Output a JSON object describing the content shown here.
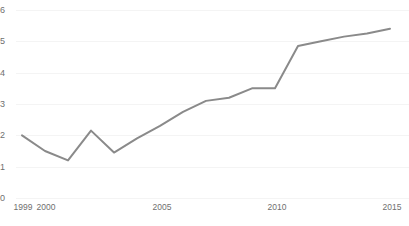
{
  "chart_data": {
    "type": "line",
    "title": "",
    "subtitle": "",
    "xlabel": "",
    "ylabel": "",
    "x": [
      1999,
      2000,
      2001,
      2002,
      2003,
      2004,
      2005,
      2006,
      2007,
      2008,
      2009,
      2010,
      2011,
      2012,
      2013,
      2014,
      2015
    ],
    "values": [
      2.0,
      1.5,
      1.2,
      2.15,
      1.45,
      1.9,
      2.3,
      2.75,
      3.1,
      3.2,
      3.5,
      3.5,
      4.85,
      5.0,
      5.15,
      5.25,
      5.4
    ],
    "series": [
      {
        "name": "series-1",
        "color": "#8a8a8a",
        "values": [
          2.0,
          1.5,
          1.2,
          2.15,
          1.45,
          1.9,
          2.3,
          2.75,
          3.1,
          3.2,
          3.5,
          3.5,
          4.85,
          5.0,
          5.15,
          5.25,
          5.4
        ]
      }
    ],
    "xlim": [
      1999,
      2015
    ],
    "ylim": [
      0,
      6
    ],
    "y_ticks": [
      "0",
      "1",
      "2",
      "3",
      "4",
      "5",
      "6"
    ],
    "y_tick_values": [
      0,
      1,
      2,
      3,
      4,
      5,
      6
    ],
    "x_ticks": [
      "1999",
      "2000",
      "2005",
      "2010",
      "2015"
    ],
    "x_tick_values": [
      1999,
      2000,
      2005,
      2010,
      2015
    ],
    "grid": true,
    "grid_axis": "y",
    "grid_color": "#f4f4f4",
    "legend": false,
    "legend_position": "none",
    "line_width": 2,
    "markers": false,
    "annotations": []
  },
  "axes": {
    "y_labels": [
      "6",
      "5",
      "4",
      "3",
      "2",
      "1",
      "0"
    ],
    "x_labels": [
      "1999",
      "2000",
      "2005",
      "2010",
      "2015"
    ]
  },
  "caption": {
    "text": ""
  },
  "colors": {
    "line": "#8a8a8a",
    "grid": "#f4f4f4",
    "tick_text": "#6f6f6f",
    "background": "#ffffff"
  }
}
